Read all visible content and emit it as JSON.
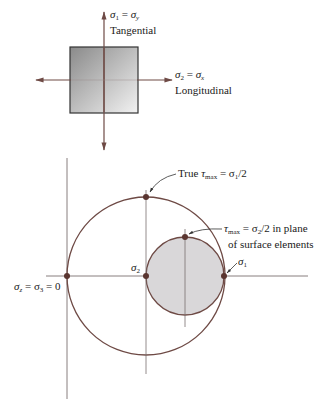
{
  "element": {
    "tangential": {
      "sym_left": "σ",
      "sub_left": "1",
      "eq": " = ",
      "sym_right": "σ",
      "sub_right": "y",
      "caption": "Tangential"
    },
    "longitudinal": {
      "sym_left": "σ",
      "sub_left": "2",
      "eq": " = ",
      "sym_right": "σ",
      "sub_right": "x",
      "caption": "Longitudinal"
    }
  },
  "mohr": {
    "true_tau": {
      "prefix": "True ",
      "sym": "τ",
      "sub": "max",
      "rest": " = σ",
      "sub2": "1",
      "tail": "/2"
    },
    "plane_tau": {
      "sym": "τ",
      "sub": "max",
      "rest": " = σ",
      "sub2": "2",
      "tail": "/2 in plane",
      "line2": "of surface elements"
    },
    "sigma2": {
      "sym": "σ",
      "sub": "2"
    },
    "sigma1": {
      "sym": "σ",
      "sub": "1"
    },
    "origin": {
      "sym": "σ",
      "sub": "z",
      "eq": " = σ",
      "sub2": "3",
      "tail": " = 0"
    }
  },
  "colors": {
    "line": "#6e4a45",
    "dot": "#5a3530",
    "fill": "#d9d7d9",
    "axis": "#7a7070"
  }
}
